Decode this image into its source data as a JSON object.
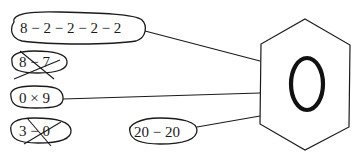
{
  "diagram": {
    "target": {
      "shape": "hexagon",
      "label": "0"
    },
    "expressions": [
      {
        "id": "expr-1",
        "text": "8 − 2 − 2 − 2 − 2",
        "connected": true,
        "crossed_out": false
      },
      {
        "id": "expr-2",
        "text": "8 − 7",
        "connected": false,
        "crossed_out": true
      },
      {
        "id": "expr-3",
        "text": "0 × 9",
        "connected": true,
        "crossed_out": false
      },
      {
        "id": "expr-4",
        "text": "3 − 0",
        "connected": false,
        "crossed_out": true
      },
      {
        "id": "expr-5",
        "text": "20 − 20",
        "connected": true,
        "crossed_out": false
      }
    ],
    "colors": {
      "ink": "#1a1a1a",
      "background": "#ffffff"
    }
  }
}
